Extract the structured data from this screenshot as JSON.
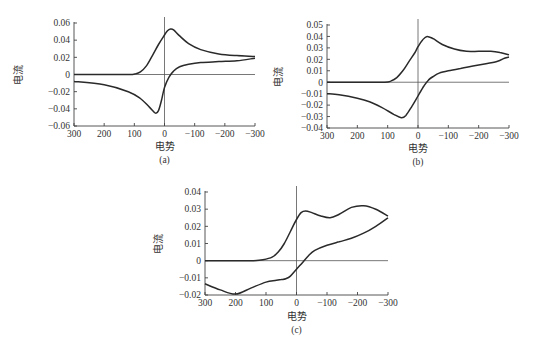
{
  "chart_data": [
    {
      "id": "a",
      "type": "line",
      "caption": "(a)",
      "xlabel": "电势",
      "ylabel": "电流",
      "xlim": [
        300,
        -300
      ],
      "ylim": [
        -0.06,
        0.06
      ],
      "xticks": [
        300,
        200,
        100,
        0,
        -100,
        -200,
        -300
      ],
      "xtick_labels": [
        "300",
        "200",
        "100",
        "0",
        "−100",
        "−200",
        "−300"
      ],
      "yticks": [
        0.06,
        0.04,
        0.02,
        0,
        -0.02,
        -0.04,
        -0.06
      ],
      "ytick_labels": [
        "0.06",
        "0.04",
        "0.02",
        "0",
        "−0.02",
        "−0.04",
        "−0.06"
      ],
      "grid": false,
      "series": [
        {
          "name": "forward_scan",
          "x": [
            300,
            200,
            120,
            100,
            80,
            60,
            40,
            20,
            0,
            -10,
            -20,
            -30,
            -50,
            -80,
            -120,
            -180,
            -240,
            -300
          ],
          "y": [
            0,
            0,
            0,
            0.0005,
            0.003,
            0.01,
            0.022,
            0.035,
            0.046,
            0.051,
            0.053,
            0.052,
            0.045,
            0.036,
            0.029,
            0.024,
            0.022,
            0.021
          ]
        },
        {
          "name": "reverse_scan",
          "x": [
            -300,
            -240,
            -180,
            -120,
            -80,
            -50,
            -30,
            -15,
            0,
            10,
            20,
            30,
            50,
            80,
            120,
            200,
            300
          ],
          "y": [
            0.019,
            0.016,
            0.015,
            0.014,
            0.012,
            0.009,
            0.004,
            -0.003,
            -0.015,
            -0.03,
            -0.042,
            -0.045,
            -0.038,
            -0.028,
            -0.02,
            -0.012,
            -0.008
          ]
        }
      ]
    },
    {
      "id": "b",
      "type": "line",
      "caption": "(b)",
      "xlabel": "电势",
      "ylabel": "电流",
      "xlim": [
        300,
        -300
      ],
      "ylim": [
        -0.04,
        0.05
      ],
      "xticks": [
        300,
        200,
        100,
        0,
        -100,
        -200,
        -300
      ],
      "xtick_labels": [
        "300",
        "200",
        "100",
        "0",
        "−100",
        "−200",
        "−300"
      ],
      "yticks": [
        0.05,
        0.04,
        0.03,
        0.02,
        0.01,
        0,
        -0.01,
        -0.02,
        -0.03,
        -0.04
      ],
      "ytick_labels": [
        "0.05",
        "0.04",
        "0.03",
        "0.02",
        "0.01",
        "0",
        "−0.01",
        "−0.02",
        "−0.03",
        "−0.04"
      ],
      "grid": false,
      "series": [
        {
          "name": "forward_scan",
          "x": [
            300,
            200,
            110,
            90,
            70,
            50,
            30,
            10,
            0,
            -15,
            -30,
            -50,
            -80,
            -120,
            -160,
            -200,
            -240,
            -270,
            -300
          ],
          "y": [
            0,
            0,
            0,
            0.001,
            0.004,
            0.01,
            0.018,
            0.026,
            0.031,
            0.037,
            0.04,
            0.038,
            0.033,
            0.029,
            0.027,
            0.027,
            0.027,
            0.026,
            0.024
          ]
        },
        {
          "name": "reverse_scan",
          "x": [
            -300,
            -285,
            -260,
            -200,
            -140,
            -100,
            -70,
            -50,
            -35,
            -20,
            0,
            20,
            40,
            55,
            80,
            120,
            160,
            200,
            260,
            300
          ],
          "y": [
            0.022,
            0.021,
            0.018,
            0.015,
            0.012,
            0.01,
            0.008,
            0.005,
            0.002,
            -0.003,
            -0.012,
            -0.021,
            -0.029,
            -0.031,
            -0.028,
            -0.022,
            -0.017,
            -0.014,
            -0.011,
            -0.01
          ]
        }
      ]
    },
    {
      "id": "c",
      "type": "line",
      "caption": "(c)",
      "xlabel": "电势",
      "ylabel": "电流",
      "xlim": [
        300,
        -300
      ],
      "ylim": [
        -0.02,
        0.04
      ],
      "xticks": [
        300,
        200,
        100,
        0,
        -100,
        -200,
        -300
      ],
      "xtick_labels": [
        "300",
        "200",
        "100",
        "0",
        "−100",
        "−200",
        "−300"
      ],
      "yticks": [
        0.04,
        0.03,
        0.02,
        0.01,
        0,
        -0.01,
        -0.02
      ],
      "ytick_labels": [
        "0.04",
        "0.03",
        "0.02",
        "0.01",
        "0",
        "−0.01",
        "−0.02"
      ],
      "grid": false,
      "series": [
        {
          "name": "forward_scan",
          "x": [
            300,
            200,
            140,
            110,
            80,
            60,
            40,
            20,
            0,
            -15,
            -30,
            -50,
            -80,
            -110,
            -140,
            -180,
            -220,
            -260,
            -300
          ],
          "y": [
            0,
            0,
            0,
            0.0005,
            0.002,
            0.005,
            0.01,
            0.017,
            0.024,
            0.028,
            0.029,
            0.028,
            0.026,
            0.025,
            0.027,
            0.031,
            0.032,
            0.03,
            0.026
          ]
        },
        {
          "name": "reverse_scan",
          "x": [
            -300,
            -260,
            -220,
            -180,
            -140,
            -100,
            -60,
            -40,
            -20,
            0,
            20,
            35,
            50,
            70,
            100,
            150,
            200,
            250,
            300
          ],
          "y": [
            0.025,
            0.02,
            0.016,
            0.013,
            0.011,
            0.009,
            0.006,
            0.003,
            -0.001,
            -0.005,
            -0.009,
            -0.0105,
            -0.011,
            -0.0115,
            -0.0125,
            -0.016,
            -0.0195,
            -0.017,
            -0.0135
          ]
        }
      ]
    }
  ]
}
